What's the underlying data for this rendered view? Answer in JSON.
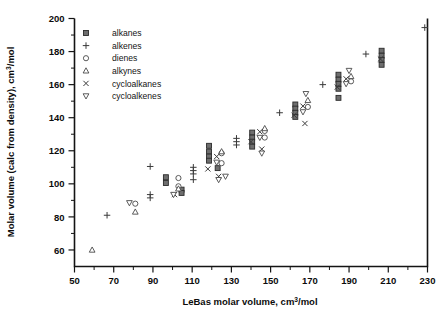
{
  "chart_data": {
    "type": "scatter",
    "title": "",
    "xlabel": "LeBas molar volume, cm3/mol",
    "ylabel": "Molar volume (calc from density), cm3/mol",
    "xlim": [
      50,
      230
    ],
    "ylim": [
      50,
      200
    ],
    "xticks": [
      50,
      70,
      90,
      110,
      130,
      150,
      170,
      190,
      210,
      230
    ],
    "xtick_labels": [
      "50",
      "70",
      "90",
      "110",
      "130",
      "150",
      "170",
      "190",
      "210",
      "230"
    ],
    "xtick_minor_step": 10,
    "yticks": [
      60,
      80,
      100,
      120,
      140,
      160,
      180,
      200
    ],
    "ytick_labels": [
      "60",
      "80",
      "100",
      "120",
      "140",
      "160",
      "180",
      "200"
    ],
    "ytick_minor_step": 10,
    "grid": false,
    "legend_position": "upper-left-inside",
    "series": [
      {
        "name": "alkanes",
        "marker": "filled-square",
        "points": [
          [
            96.6,
            104.0
          ],
          [
            96.6,
            100.5
          ],
          [
            104.6,
            96.5
          ],
          [
            104.6,
            94.5
          ],
          [
            118.6,
            123.0
          ],
          [
            118.6,
            119.5
          ],
          [
            118.6,
            116.5
          ],
          [
            118.6,
            114.0
          ],
          [
            123.0,
            109.5
          ],
          [
            140.6,
            131.0
          ],
          [
            140.6,
            128.0
          ],
          [
            140.6,
            125.5
          ],
          [
            140.6,
            122.5
          ],
          [
            162.6,
            148.0
          ],
          [
            162.6,
            145.5
          ],
          [
            162.6,
            143.0
          ],
          [
            162.6,
            140.5
          ],
          [
            184.6,
            166.0
          ],
          [
            184.6,
            163.0
          ],
          [
            184.6,
            160.5
          ],
          [
            184.6,
            157.5
          ],
          [
            184.6,
            152.0
          ],
          [
            206.6,
            180.5
          ],
          [
            206.6,
            177.5
          ],
          [
            206.6,
            175.0
          ],
          [
            206.6,
            172.0
          ]
        ]
      },
      {
        "name": "alkenes",
        "marker": "plus",
        "points": [
          [
            66.6,
            81.0
          ],
          [
            88.6,
            110.5
          ],
          [
            88.6,
            93.5
          ],
          [
            88.6,
            91.5
          ],
          [
            110.6,
            110.0
          ],
          [
            110.6,
            108.0
          ],
          [
            110.6,
            106.0
          ],
          [
            110.6,
            102.5
          ],
          [
            132.6,
            127.5
          ],
          [
            132.6,
            125.5
          ],
          [
            132.6,
            123.5
          ],
          [
            154.6,
            143.0
          ],
          [
            176.6,
            160.0
          ],
          [
            198.6,
            178.5
          ],
          [
            228.6,
            194.5
          ]
        ]
      },
      {
        "name": "dienes",
        "marker": "open-circle",
        "points": [
          [
            81.0,
            88.0
          ],
          [
            103.0,
            103.5
          ],
          [
            103.0,
            98.5
          ],
          [
            125.0,
            118.5
          ],
          [
            125.0,
            112.5
          ],
          [
            147.0,
            132.0
          ],
          [
            147.0,
            128.0
          ],
          [
            169.0,
            146.5
          ],
          [
            191.0,
            162.0
          ]
        ]
      },
      {
        "name": "alkynes",
        "marker": "open-triangle-up",
        "points": [
          [
            59.0,
            60.0
          ],
          [
            81.0,
            83.0
          ],
          [
            103.0,
            97.0
          ],
          [
            125.0,
            119.5
          ],
          [
            147.0,
            133.5
          ],
          [
            169.0,
            150.5
          ],
          [
            191.0,
            165.0
          ]
        ]
      },
      {
        "name": "cycloalkanes",
        "marker": "cross",
        "points": [
          [
            101.0,
            93.5
          ],
          [
            118.0,
            109.0
          ],
          [
            122.5,
            116.5
          ],
          [
            123.5,
            104.5
          ],
          [
            140.0,
            125.5
          ],
          [
            144.5,
            131.5
          ],
          [
            145.5,
            121.0
          ],
          [
            162.0,
            141.5
          ],
          [
            166.5,
            147.0
          ],
          [
            167.5,
            136.5
          ],
          [
            184.0,
            158.5
          ],
          [
            188.5,
            163.5
          ],
          [
            206.0,
            175.5
          ]
        ]
      },
      {
        "name": "cycloalkenes",
        "marker": "open-triangle-down",
        "points": [
          [
            78.0,
            88.5
          ],
          [
            100.5,
            93.5
          ],
          [
            122.5,
            113.0
          ],
          [
            123.5,
            102.5
          ],
          [
            127.0,
            104.5
          ],
          [
            144.5,
            128.0
          ],
          [
            145.5,
            118.5
          ],
          [
            166.5,
            143.5
          ],
          [
            168.0,
            154.5
          ],
          [
            188.5,
            160.5
          ],
          [
            190.0,
            168.5
          ]
        ]
      }
    ]
  },
  "legend": {
    "items": [
      {
        "label": "alkanes",
        "marker": "filled-square"
      },
      {
        "label": "alkenes",
        "marker": "plus"
      },
      {
        "label": "dienes",
        "marker": "open-circle"
      },
      {
        "label": "alkynes",
        "marker": "open-triangle-up"
      },
      {
        "label": "cycloalkanes",
        "marker": "cross"
      },
      {
        "label": "cycloalkenes",
        "marker": "open-triangle-down"
      }
    ]
  },
  "axis_titles": {
    "x_pre": "LeBas molar volume, cm",
    "x_sup": "3",
    "x_post": "/mol",
    "y_pre": "Molar volume (calc from density), cm",
    "y_sup": "3",
    "y_post": "/mol"
  },
  "colors": {
    "axis": "#141414",
    "marker_fill": "#6e6e6e",
    "marker_stroke": "#3a3a3a",
    "background": "#ffffff"
  }
}
